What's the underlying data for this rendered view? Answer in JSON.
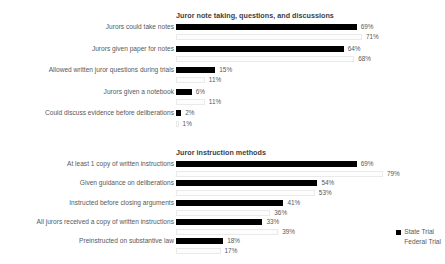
{
  "legend": {
    "items": [
      {
        "label": "State Trial",
        "color": "#000000",
        "key": "state"
      },
      {
        "label": "Federal Trial",
        "color": "#ffffff",
        "key": "federal"
      }
    ]
  },
  "chart_data": [
    {
      "type": "bar",
      "orientation": "horizontal",
      "grouped": true,
      "title": "Juror note taking, questions, and discussions",
      "xlabel": "",
      "ylabel": "",
      "xlim": [
        0,
        100
      ],
      "grid": false,
      "legend_position": "bottom-right",
      "value_suffix": "%",
      "categories": [
        "Jurors could take notes",
        "Jurors given paper for notes",
        "Allowed written juror questions during trials",
        "Jurors given a notebook",
        "Could discuss evidence before deliberations"
      ],
      "series": [
        {
          "name": "State Trial",
          "color": "#000000",
          "values": [
            69,
            64,
            15,
            6,
            2
          ]
        },
        {
          "name": "Federal Trial",
          "color": "#ffffff",
          "values": [
            71,
            68,
            11,
            11,
            1
          ]
        }
      ],
      "labels": [
        {
          "state": "69%",
          "federal": "71%"
        },
        {
          "state": "64%",
          "federal": "68%"
        },
        {
          "state": "15%",
          "federal": "11%"
        },
        {
          "state": "6%",
          "federal": "11%"
        },
        {
          "state": "2%",
          "federal": "1%"
        }
      ]
    },
    {
      "type": "bar",
      "orientation": "horizontal",
      "grouped": true,
      "title": "Juror instruction methods",
      "xlabel": "",
      "ylabel": "",
      "xlim": [
        0,
        100
      ],
      "grid": false,
      "legend_position": "bottom-right",
      "value_suffix": "%",
      "categories": [
        "At least 1 copy of written instructions",
        "Given guidance on deliberations",
        "Instructed before closing arguments",
        "All jurors received a copy of written instructions",
        "Preinstructed on substantive law"
      ],
      "series": [
        {
          "name": "State Trial",
          "color": "#000000",
          "values": [
            69,
            54,
            41,
            33,
            18
          ]
        },
        {
          "name": "Federal Trial",
          "color": "#ffffff",
          "values": [
            79,
            53,
            36,
            39,
            17
          ]
        }
      ],
      "labels": [
        {
          "state": "69%",
          "federal": "79%"
        },
        {
          "state": "54%",
          "federal": "53%"
        },
        {
          "state": "41%",
          "federal": "36%"
        },
        {
          "state": "33%",
          "federal": "39%"
        },
        {
          "state": "18%",
          "federal": "17%"
        }
      ]
    }
  ]
}
